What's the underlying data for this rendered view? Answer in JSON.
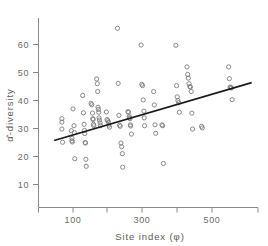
{
  "chart_data": {
    "type": "scatter",
    "title": "",
    "xlabel": "Site index (φ)",
    "ylabel": "α̂-diversity",
    "xlim": [
      40,
      620
    ],
    "ylim": [
      5,
      68
    ],
    "xticks": [
      100,
      200,
      300,
      400,
      500
    ],
    "xticklabels": [
      "100",
      "",
      "300",
      "",
      "500"
    ],
    "yticks": [
      10,
      20,
      30,
      40,
      50,
      60
    ],
    "yticklabels": [
      "10",
      "20",
      "30",
      "40",
      "50",
      "60"
    ],
    "grid": false,
    "legend": null,
    "marker": "open-circle",
    "points": [
      [
        68,
        33.5
      ],
      [
        68,
        32.3
      ],
      [
        68,
        29.8
      ],
      [
        70,
        25.1
      ],
      [
        95,
        29.2
      ],
      [
        97,
        26.5
      ],
      [
        97,
        25.6
      ],
      [
        98,
        25.2
      ],
      [
        100,
        37.0
      ],
      [
        103,
        31.0
      ],
      [
        104,
        28.5
      ],
      [
        105,
        19.2
      ],
      [
        128,
        41.8
      ],
      [
        130,
        35.6
      ],
      [
        132,
        31.5
      ],
      [
        133,
        29.3
      ],
      [
        134,
        28.2
      ],
      [
        135,
        25.0
      ],
      [
        136,
        24.8
      ],
      [
        137,
        19.0
      ],
      [
        138,
        16.5
      ],
      [
        152,
        39.0
      ],
      [
        154,
        38.5
      ],
      [
        156,
        35.5
      ],
      [
        157,
        33.5
      ],
      [
        158,
        33.2
      ],
      [
        159,
        31.5
      ],
      [
        160,
        31.0
      ],
      [
        168,
        47.7
      ],
      [
        170,
        46.0
      ],
      [
        171,
        43.2
      ],
      [
        172,
        37.6
      ],
      [
        173,
        36.8
      ],
      [
        174,
        35.8
      ],
      [
        175,
        33.8
      ],
      [
        176,
        33.0
      ],
      [
        178,
        32.0
      ],
      [
        179,
        31.0
      ],
      [
        196,
        35.9
      ],
      [
        198,
        33.2
      ],
      [
        200,
        32.8
      ],
      [
        202,
        32.3
      ],
      [
        203,
        31.2
      ],
      [
        205,
        30.5
      ],
      [
        228,
        65.8
      ],
      [
        230,
        46.1
      ],
      [
        232,
        34.7
      ],
      [
        234,
        31.2
      ],
      [
        236,
        30.8
      ],
      [
        238,
        24.8
      ],
      [
        240,
        23.5
      ],
      [
        242,
        21.0
      ],
      [
        243,
        16.2
      ],
      [
        258,
        36.0
      ],
      [
        260,
        35.8
      ],
      [
        262,
        34.2
      ],
      [
        263,
        33.8
      ],
      [
        264,
        33.5
      ],
      [
        265,
        31.3
      ],
      [
        266,
        30.9
      ],
      [
        268,
        28.0
      ],
      [
        296,
        59.8
      ],
      [
        298,
        45.8
      ],
      [
        300,
        45.3
      ],
      [
        302,
        40.2
      ],
      [
        304,
        36.2
      ],
      [
        305,
        33.8
      ],
      [
        306,
        31.0
      ],
      [
        332,
        43.2
      ],
      [
        334,
        38.4
      ],
      [
        336,
        31.3
      ],
      [
        338,
        28.3
      ],
      [
        356,
        31.3
      ],
      [
        358,
        31.0
      ],
      [
        360,
        17.5
      ],
      [
        396,
        59.7
      ],
      [
        398,
        45.3
      ],
      [
        400,
        41.3
      ],
      [
        402,
        40.0
      ],
      [
        404,
        39.2
      ],
      [
        406,
        35.8
      ],
      [
        428,
        52.0
      ],
      [
        430,
        49.3
      ],
      [
        432,
        48.0
      ],
      [
        434,
        46.0
      ],
      [
        436,
        45.0
      ],
      [
        438,
        44.8
      ],
      [
        440,
        43.2
      ],
      [
        442,
        35.5
      ],
      [
        444,
        29.8
      ],
      [
        470,
        30.8
      ],
      [
        472,
        30.2
      ],
      [
        548,
        52.0
      ],
      [
        550,
        47.8
      ],
      [
        552,
        44.8
      ],
      [
        554,
        44.6
      ],
      [
        556,
        44.5
      ],
      [
        558,
        40.3
      ]
    ],
    "fit_line": {
      "label": "regression line",
      "x_start": 48,
      "y_start": 25.8,
      "x_end": 612,
      "y_end": 46.3
    }
  }
}
